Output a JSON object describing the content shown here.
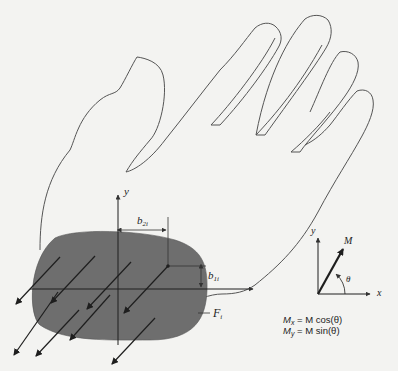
{
  "figure": {
    "colors": {
      "background": "#f3f3f1",
      "outline": "#555555",
      "contact_patch": "#6e6e6e",
      "arrows": "#1e1e1e",
      "text": "#222222"
    }
  },
  "labels": {
    "y_axis_main": "y",
    "b2": "b",
    "b2_sub": "2i",
    "b1": "b",
    "b1_sub": "1i",
    "force": "F",
    "force_sub": "i",
    "inset_y": "y",
    "inset_x": "x",
    "inset_M": "M",
    "inset_theta": "θ"
  },
  "equations": {
    "mx_lhs": "M",
    "mx_sub": "x",
    "mx_rhs": "= M cos(θ)",
    "my_lhs": "M",
    "my_sub": "y",
    "my_rhs": "= M sin(θ)"
  }
}
